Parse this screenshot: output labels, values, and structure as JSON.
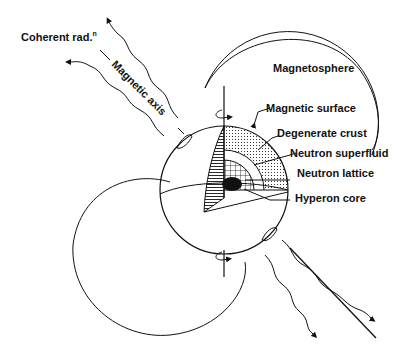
{
  "labels": {
    "coherent_radiation": "Coherent rad.",
    "coherent_radiation_sup": "n",
    "magnetic_axis": "Magnetic axis",
    "magnetosphere": "Magnetosphere",
    "magnetic_surface": "Magnetic surface",
    "degenerate_crust": "Degenerate crust",
    "neutron_superfluid": "Neutron superfluid",
    "neutron_lattice": "Neutron lattice",
    "hyperon_core": "Hyperon core"
  },
  "colors": {
    "ink": "#111111",
    "background": "#ffffff"
  }
}
